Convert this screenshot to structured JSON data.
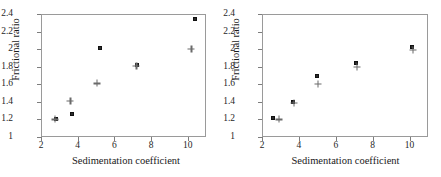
{
  "figure": {
    "panels": [
      {
        "name": "left-panel",
        "xlabel": "Sedimentation coefficient",
        "ylabel": "Frictional ratio"
      },
      {
        "name": "right-panel",
        "xlabel": "Sedimentation coefficient",
        "ylabel": "Frictional ratio"
      }
    ]
  },
  "axes": {
    "x_ticks": [
      "2",
      "4",
      "6",
      "8",
      "10"
    ],
    "y_ticks": [
      "1",
      "1.2",
      "1.4",
      "1.6",
      "1.8",
      "2",
      "2.2",
      "2.4"
    ],
    "x_title": "Sedimentation coefficient",
    "y_title": "Frictional ratio"
  },
  "colors": {
    "square_marker": "#2b2b2b",
    "plus_marker": "#6a6a6a",
    "frame": "#9a9a9a",
    "background": "#ffffff"
  },
  "chart_data": [
    {
      "type": "scatter",
      "panel": "left",
      "title": "",
      "xlabel": "Sedimentation coefficient",
      "ylabel": "Frictional ratio",
      "xlim": [
        2,
        11
      ],
      "ylim": [
        1,
        2.4
      ],
      "xticks": [
        2,
        4,
        6,
        8,
        10
      ],
      "yticks": [
        1,
        1.2,
        1.4,
        1.6,
        1.8,
        2,
        2.2,
        2.4
      ],
      "grid": false,
      "legend": "none",
      "series": [
        {
          "name": "square",
          "marker": "filled-square",
          "points": [
            {
              "x": 2.8,
              "y": 1.2
            },
            {
              "x": 3.7,
              "y": 1.26
            },
            {
              "x": 5.2,
              "y": 2.01
            },
            {
              "x": 7.25,
              "y": 1.82
            },
            {
              "x": 10.4,
              "y": 2.34
            }
          ]
        },
        {
          "name": "plus",
          "marker": "plus",
          "points": [
            {
              "x": 2.75,
              "y": 1.2
            },
            {
              "x": 3.6,
              "y": 1.41
            },
            {
              "x": 5.05,
              "y": 1.61
            },
            {
              "x": 7.2,
              "y": 1.81
            },
            {
              "x": 10.2,
              "y": 2.0
            }
          ]
        }
      ]
    },
    {
      "type": "scatter",
      "panel": "right",
      "title": "",
      "xlabel": "Sedimentation coefficient",
      "ylabel": "Frictional ratio",
      "xlim": [
        2,
        11
      ],
      "ylim": [
        1,
        2.4
      ],
      "xticks": [
        2,
        4,
        6,
        8,
        10
      ],
      "yticks": [
        1,
        1.2,
        1.4,
        1.6,
        1.8,
        2,
        2.2,
        2.4
      ],
      "grid": false,
      "legend": "none",
      "series": [
        {
          "name": "square",
          "marker": "filled-square",
          "points": [
            {
              "x": 2.6,
              "y": 1.22
            },
            {
              "x": 3.7,
              "y": 1.4
            },
            {
              "x": 5.0,
              "y": 1.7
            },
            {
              "x": 7.1,
              "y": 1.84
            },
            {
              "x": 10.15,
              "y": 2.02
            }
          ]
        },
        {
          "name": "plus",
          "marker": "plus",
          "points": [
            {
              "x": 2.9,
              "y": 1.2
            },
            {
              "x": 3.75,
              "y": 1.39
            },
            {
              "x": 5.05,
              "y": 1.6
            },
            {
              "x": 7.15,
              "y": 1.8
            },
            {
              "x": 10.2,
              "y": 1.99
            }
          ]
        }
      ]
    }
  ]
}
